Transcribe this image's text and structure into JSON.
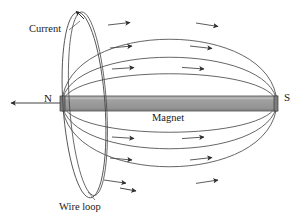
{
  "figure": {
    "title_visible": false,
    "labels": {
      "current": "Current",
      "north_pole": "N",
      "magnet": "Magnet",
      "south_pole": "S",
      "wire_loop": "Wire loop"
    },
    "colors": {
      "stroke": "#3a3a3a",
      "magnet_fill": "#9a9a9a",
      "magnet_stroke": "#4a4a4a",
      "background": "#ffffff",
      "text": "#1a1a1a"
    },
    "magnet": {
      "x_left": 62,
      "x_right": 277,
      "y_top": 96,
      "y_bottom": 111,
      "axis_y": 103
    },
    "pole_arrow": {
      "description": "axis arrow pointing left out of the north pole",
      "x_start": 62,
      "x_end": 8,
      "y": 103,
      "direction": "left"
    },
    "field_lines": {
      "count": 6,
      "direction": "north-to-south",
      "above": [
        {
          "ry": 82,
          "arrowheads": 2
        },
        {
          "ry": 62,
          "arrowheads": 2
        },
        {
          "ry": 40,
          "arrowheads": 2
        }
      ],
      "below": [
        {
          "ry": 40,
          "arrowheads": 2
        },
        {
          "ry": 62,
          "arrowheads": 2
        },
        {
          "ry": 82,
          "arrowheads": 2
        }
      ]
    },
    "wire_loop": {
      "center_x": 84,
      "center_y": 105,
      "rx": 21,
      "ry": 93,
      "tilt_deg": -4,
      "turns": 2,
      "current_arrow_direction": "up-left"
    }
  }
}
